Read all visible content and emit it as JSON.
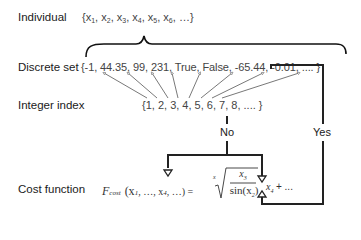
{
  "labels": {
    "individual": "Individual",
    "discrete_set": "Discrete set",
    "integer_index": "Integer index",
    "cost_function": "Cost function"
  },
  "individual_set": {
    "open": "{",
    "items": [
      {
        "base": "x",
        "sub": "1"
      },
      {
        "base": "x",
        "sub": "2"
      },
      {
        "base": "x",
        "sub": "3"
      },
      {
        "base": "x",
        "sub": "4"
      },
      {
        "base": "x",
        "sub": "5"
      },
      {
        "base": "x",
        "sub": "6"
      }
    ],
    "tail": "…}"
  },
  "discrete_set_values": "{-1, 44.35, 99, 231, True, False, -65.44, -0.01, .... }",
  "integer_index_values": "{1, 2, 3, 4, 5, 6, 7, 8, .... }",
  "decision": {
    "no": "No",
    "yes": "Yes"
  },
  "formula": {
    "F": "F",
    "F_sub": "cost",
    "args": "(x",
    "args_sub1": "1",
    "args_mid": ", …, x",
    "args_sub4": "4",
    "args_end": ", …) =",
    "root_index": "x",
    "numerator": "x",
    "numerator_sub": "3",
    "denominator": "sin(x",
    "denominator_sub": "2",
    "denominator_end": ")",
    "after": "x",
    "after_sub": "4",
    "tail": "+ ..."
  },
  "colors": {
    "line": "#222222",
    "arrow_gray": "#555555",
    "text": "#1a1a1a",
    "set_text": "#444444"
  }
}
